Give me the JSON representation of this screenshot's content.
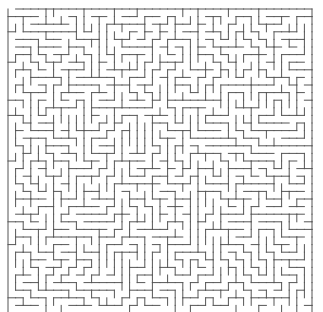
{
  "maze": {
    "cols": 40,
    "rows": 40,
    "origin_x": 8,
    "origin_y": 9,
    "cell": 7.6,
    "wall_color": "#555555",
    "background": "#ffffff",
    "entrance": {
      "side": "top",
      "col": 0
    },
    "exit": {
      "side": "bottom",
      "col": 39
    },
    "seed": 20240531
  }
}
